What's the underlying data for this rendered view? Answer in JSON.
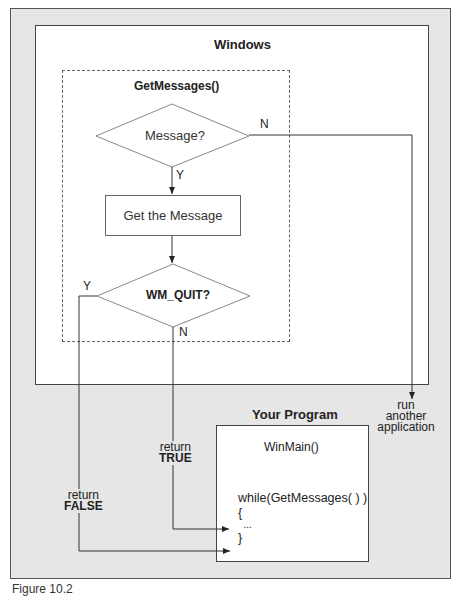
{
  "diagram": {
    "outer_background": "#e6e6e6",
    "windows": {
      "title": "Windows"
    },
    "getmessages": {
      "title": "GetMessages()",
      "decision1": {
        "label": "Message?",
        "yes": "Y",
        "no": "N"
      },
      "process": {
        "label": "Get the Message"
      },
      "decision2": {
        "label": "WM_QUIT?",
        "yes": "Y",
        "no": "N"
      }
    },
    "run_other": {
      "line1": "run",
      "line2": "another",
      "line3": "application"
    },
    "return_true": {
      "line1": "return",
      "line2": "TRUE"
    },
    "return_false": {
      "line1": "return",
      "line2": "FALSE"
    },
    "program": {
      "title": "Your Program",
      "function": "WinMain()",
      "code_line1": "while(GetMessages( ) )",
      "code_line2": "{",
      "code_line3": "  ...",
      "code_line4": "}"
    },
    "caption": "Figure 10.2"
  }
}
